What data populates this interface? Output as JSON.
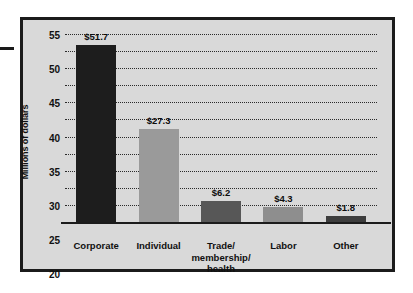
{
  "chart_data": {
    "type": "bar",
    "title": "",
    "subtitle": "",
    "xlabel": "",
    "ylabel": "Millions of dollars",
    "ylim": [
      0,
      55
    ],
    "ytick_step": 5,
    "yticks": [
      "55",
      "50",
      "45",
      "40",
      "35",
      "30",
      "25",
      "20",
      "15",
      "10",
      "5",
      "0"
    ],
    "grid": true,
    "grid_style": "dotted-horizontal",
    "legend": "none",
    "categories": [
      "Corporate",
      "Individual",
      "Trade/\nmembership/\nhealth",
      "Labor",
      "Other"
    ],
    "category_lines": [
      [
        "Corporate"
      ],
      [
        "Individual"
      ],
      [
        "Trade/",
        "membership/",
        "health"
      ],
      [
        "Labor"
      ],
      [
        "Other"
      ]
    ],
    "values": [
      51.7,
      27.3,
      6.2,
      4.3,
      1.8
    ],
    "value_labels": [
      "$51.7",
      "$27.3",
      "$6.2",
      "$4.3",
      "$1.8"
    ],
    "bar_colors": [
      "#1d1d1d",
      "#9a9a9a",
      "#575757",
      "#8e8e8e",
      "#3d3d3d"
    ],
    "units": "Millions of dollars",
    "currency": "$"
  },
  "figure": {
    "background_color": "#ffffff",
    "plot_background_color": "#d9d9d9",
    "frame_color": "#1b1b1b",
    "axis_color": "#1b1b1b",
    "grid_color": "#2a2a2a",
    "text_color": "#101010"
  }
}
